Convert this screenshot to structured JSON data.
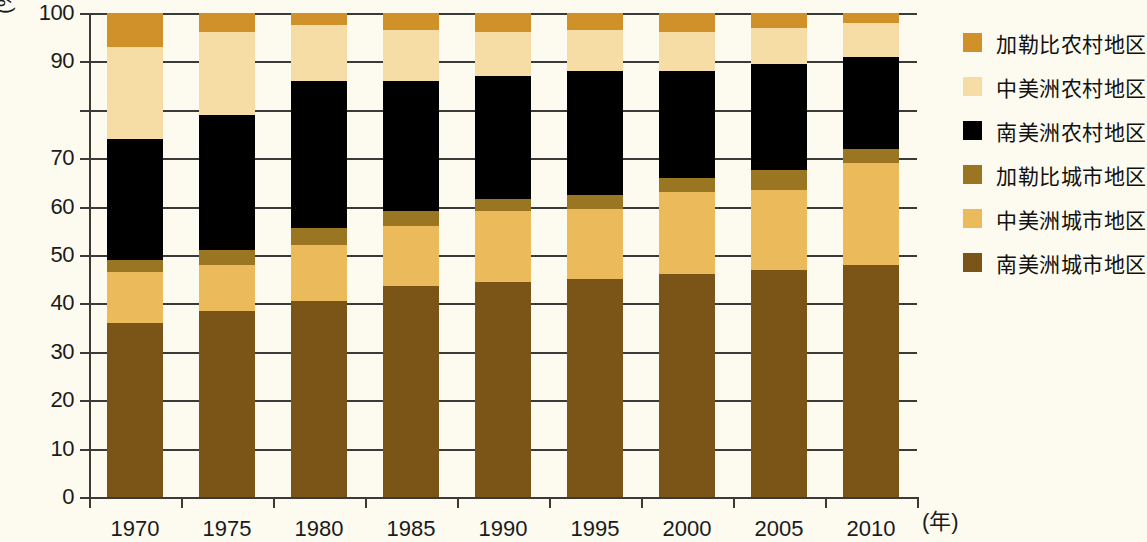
{
  "axis": {
    "y_title": "(%)",
    "x_unit": "(年)",
    "y_ticks": [
      {
        "value": 100,
        "label": "100"
      },
      {
        "value": 90,
        "label": "90"
      },
      {
        "value": 80,
        "label": ""
      },
      {
        "value": 70,
        "label": "70"
      },
      {
        "value": 60,
        "label": "60"
      },
      {
        "value": 50,
        "label": "50"
      },
      {
        "value": 40,
        "label": "40"
      },
      {
        "value": 30,
        "label": "30"
      },
      {
        "value": 20,
        "label": "20"
      },
      {
        "value": 10,
        "label": "10"
      },
      {
        "value": 0,
        "label": "0"
      }
    ]
  },
  "colors": {
    "caribbean_rural": "#d1912a",
    "central_america_rural": "#f6dda6",
    "south_america_rural": "#000000",
    "caribbean_urban": "#9a7622",
    "central_america_urban": "#eaba5b",
    "south_america_urban": "#7b5518",
    "axis": "#3a3a38",
    "background": "#fdfaf0"
  },
  "legend": {
    "items": [
      {
        "label": "加勒比农村地区",
        "key": "caribbean_rural"
      },
      {
        "label": "中美洲农村地区",
        "key": "central_america_rural"
      },
      {
        "label": "南美洲农村地区",
        "key": "south_america_rural"
      },
      {
        "label": "加勒比城市地区",
        "key": "caribbean_urban"
      },
      {
        "label": "中美洲城市地区",
        "key": "central_america_urban"
      },
      {
        "label": "南美洲城市地区",
        "key": "south_america_urban"
      }
    ]
  },
  "chart_data": {
    "type": "bar",
    "stacked": true,
    "title": "",
    "xlabel": "(年)",
    "ylabel": "(%)",
    "ylim": [
      0,
      100
    ],
    "grid": true,
    "legend_position": "right",
    "categories": [
      "1970",
      "1975",
      "1980",
      "1985",
      "1990",
      "1995",
      "2000",
      "2005",
      "2010"
    ],
    "series": [
      {
        "name": "南美洲城市地区",
        "color": "#7b5518",
        "values": [
          36.0,
          38.5,
          40.5,
          43.5,
          44.5,
          45.0,
          46.0,
          47.0,
          48.0
        ]
      },
      {
        "name": "中美洲城市地区",
        "color": "#eaba5b",
        "values": [
          10.5,
          9.5,
          11.5,
          12.5,
          14.5,
          14.5,
          17.0,
          16.5,
          21.0
        ]
      },
      {
        "name": "加勒比城市地区",
        "color": "#9a7622",
        "values": [
          2.5,
          3.0,
          3.5,
          3.0,
          2.5,
          3.0,
          3.0,
          4.0,
          3.0
        ]
      },
      {
        "name": "南美洲农村地区",
        "color": "#000000",
        "values": [
          25.0,
          28.0,
          30.5,
          27.0,
          25.5,
          25.5,
          22.0,
          22.0,
          19.0
        ]
      },
      {
        "name": "中美洲农村地区",
        "color": "#f6dda6",
        "values": [
          19.0,
          17.0,
          11.5,
          10.5,
          9.0,
          8.5,
          8.0,
          7.5,
          7.0
        ]
      },
      {
        "name": "加勒比农村地区",
        "color": "#d1912a",
        "values": [
          7.0,
          4.0,
          2.5,
          3.5,
          4.0,
          3.5,
          4.0,
          3.0,
          2.0
        ]
      }
    ]
  }
}
